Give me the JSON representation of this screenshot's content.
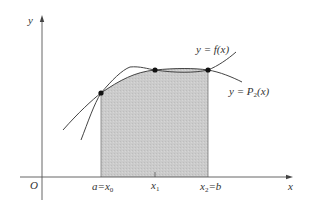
{
  "diagram": {
    "axes": {
      "x_label": "x",
      "y_label": "y",
      "origin_label": "O"
    },
    "curves": [
      {
        "name": "f",
        "label_prefix": "y = ",
        "label_main": "f(x)"
      },
      {
        "name": "P2",
        "label_prefix": "y = ",
        "label_main": "P",
        "label_sub": "2",
        "label_suffix": "(x)"
      }
    ],
    "nodes": [
      {
        "label_a": "a=x",
        "label_sub": "0"
      },
      {
        "label_a": "x",
        "label_sub": "1"
      },
      {
        "label_a": "x",
        "label_sub": "2",
        "label_suffix": "=b"
      }
    ],
    "colors": {
      "shade": "#c8c8c8",
      "line": "#444444",
      "axis": "#555555",
      "point": "#111111"
    }
  }
}
